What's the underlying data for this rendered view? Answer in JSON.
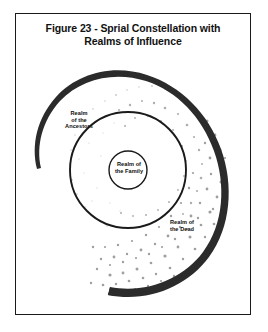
{
  "figure": {
    "title_line_1": "Figure 23 - Sprial Constellation with",
    "title_line_2": "Realms of Influence",
    "frame_color": "#1a1a1a",
    "background_color": "#ffffff"
  },
  "diagram": {
    "type": "spiral-constellation",
    "spiral_color": "#2b2b2b",
    "ring_color": "#1a1a1a",
    "stipple_color": "#9a9a9a",
    "regions": [
      {
        "id": "ancestors",
        "label_line_1": "Realm",
        "label_line_2": "of the",
        "label_line_3": "Ancestors"
      },
      {
        "id": "family",
        "label_line_1": "Realm of",
        "label_line_2": "the Family"
      },
      {
        "id": "dead",
        "label_line_1": "Realm of",
        "label_line_2": "the Dead"
      }
    ]
  }
}
